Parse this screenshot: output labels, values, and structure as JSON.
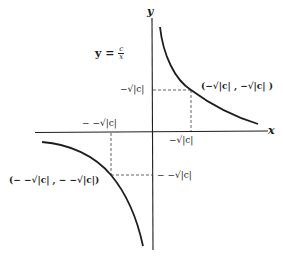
{
  "figure": {
    "title_equation": {
      "lhs": "y =",
      "numerator": "c",
      "denominator": "x"
    },
    "axes": {
      "x_label": "x",
      "y_label": "y"
    },
    "tick_labels": {
      "y_positive": "−√|c|",
      "x_positive": "−√|c|",
      "x_negative": "− −√|c|",
      "y_negative": "− −√|c|"
    },
    "points": {
      "upper_right": "(−√|c| , −√|c| )",
      "lower_left": "(− −√|c| , − −√|c|)"
    },
    "colors": {
      "ink": "#1e1e1e",
      "background": "#ffffff"
    }
  }
}
